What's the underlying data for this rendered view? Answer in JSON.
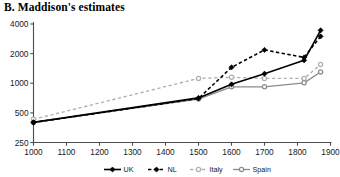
{
  "chart_data": {
    "type": "line",
    "title": "B. Maddison's estimates",
    "xlabel": "",
    "ylabel": "",
    "yscale": "log",
    "ylim": [
      250,
      4000
    ],
    "xlim": [
      1000,
      1900
    ],
    "yticks": [
      250,
      500,
      1000,
      2000,
      4000
    ],
    "ytick_labels": [
      "250",
      "500",
      "1000",
      "2000",
      "4000"
    ],
    "xticks": [
      1000,
      1100,
      1200,
      1300,
      1400,
      1500,
      1600,
      1700,
      1800,
      1900
    ],
    "xtick_labels": [
      "1000",
      "1100",
      "1200",
      "1300",
      "1400",
      "1500",
      "1600",
      "1700",
      "1800",
      "1900"
    ],
    "grid": false,
    "legend_position": "bottom",
    "series": [
      {
        "name": "UK",
        "color": "#000000",
        "linestyle": "solid",
        "marker": "diamond",
        "x": [
          1000,
          1500,
          1600,
          1700,
          1820,
          1870
        ],
        "values": [
          400,
          710,
          975,
          1250,
          1710,
          3450
        ]
      },
      {
        "name": "NL",
        "color": "#000000",
        "linestyle": "dashed",
        "marker": "diamond",
        "x": [
          1000,
          1500,
          1600,
          1700,
          1820,
          1870
        ],
        "values": [
          400,
          700,
          1450,
          2180,
          1830,
          3000
        ]
      },
      {
        "name": "Italy",
        "color": "#b0b0b0",
        "linestyle": "dashed",
        "marker": "circle",
        "x": [
          1000,
          1500,
          1600,
          1700,
          1820,
          1870
        ],
        "values": [
          430,
          1120,
          1150,
          1120,
          1120,
          1550
        ]
      },
      {
        "name": "Spain",
        "color": "#8c8c8c",
        "linestyle": "solid",
        "marker": "circle",
        "x": [
          1000,
          1500,
          1600,
          1700,
          1820,
          1870
        ],
        "values": [
          400,
          690,
          920,
          920,
          1010,
          1300
        ]
      }
    ]
  },
  "legend": {
    "items": [
      {
        "label": "UK"
      },
      {
        "label": "NL"
      },
      {
        "label": "Italy"
      },
      {
        "label": "Spain"
      }
    ]
  }
}
